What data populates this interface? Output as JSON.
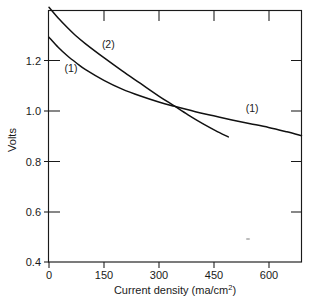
{
  "chart_data": {
    "type": "line",
    "title": "",
    "xlabel": "Current density (ma/cm2)",
    "xlabel_main": "Current density  (ma/cm",
    "xlabel_sup": "2",
    "xlabel_tail": ")",
    "ylabel": "Volts",
    "xlim": [
      0,
      690
    ],
    "ylim": [
      0.4,
      1.2
    ],
    "xticks": [
      0,
      150,
      300,
      450,
      600
    ],
    "xtick_labels": [
      "0",
      "150",
      "300",
      "450",
      "600"
    ],
    "yticks": [
      0.4,
      0.6,
      0.8,
      1.0,
      1.2
    ],
    "ytick_labels": [
      "0.4",
      "0.6",
      "0.8",
      "1.0",
      "1.2"
    ],
    "grid": false,
    "legend": "inline-annotations",
    "series": [
      {
        "name": "(1)",
        "label": "(1)",
        "x": [
          0,
          25,
          50,
          75,
          100,
          150,
          200,
          250,
          300,
          340,
          400,
          450,
          500,
          550,
          600,
          650,
          690
        ],
        "y": [
          1.115,
          1.083,
          1.056,
          1.033,
          1.012,
          0.978,
          0.95,
          0.928,
          0.909,
          0.896,
          0.878,
          0.865,
          0.852,
          0.84,
          0.828,
          0.814,
          0.802
        ]
      },
      {
        "name": "(2)",
        "label": "(2)",
        "x": [
          0,
          25,
          50,
          75,
          100,
          150,
          200,
          250,
          300,
          340,
          380,
          420,
          455,
          490
        ],
        "y": [
          1.21,
          1.176,
          1.146,
          1.118,
          1.094,
          1.05,
          1.008,
          0.968,
          0.928,
          0.898,
          0.868,
          0.84,
          0.818,
          0.798
        ]
      }
    ],
    "annotations": [
      {
        "text": "(1)",
        "x": 60,
        "y": 1.005,
        "id": "curve1-label-left"
      },
      {
        "text": "(2)",
        "x": 162,
        "y": 1.082,
        "id": "curve2-label"
      },
      {
        "text": "(1)",
        "x": 555,
        "y": 0.877,
        "id": "curve1-label-right"
      }
    ]
  },
  "axis": {
    "y_title": "Volts"
  }
}
